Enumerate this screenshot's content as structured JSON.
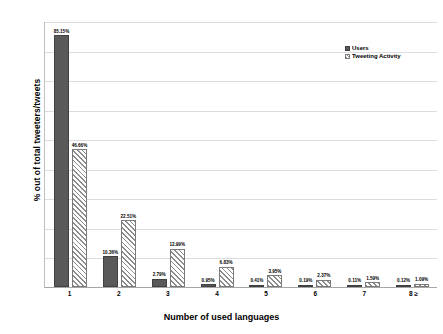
{
  "chart_data": {
    "type": "bar",
    "title": "",
    "xlabel": "Number of used languages",
    "ylabel": "% out of total tweeters/tweets",
    "categories": [
      "1",
      "2",
      "3",
      "4",
      "5",
      "6",
      "7",
      "8 ≥"
    ],
    "series": [
      {
        "name": "Users",
        "values": [
          85.15,
          10.36,
          2.79,
          0.95,
          0.41,
          0.19,
          0.11,
          0.12
        ],
        "labels": [
          "85.15%",
          "10.36%",
          "2.79%",
          "0.95%",
          "0.41%",
          "0.19%",
          "0.11%",
          "0.12%"
        ],
        "style": "solid",
        "color": "#595959"
      },
      {
        "name": "Tweeting Activity",
        "values": [
          46.66,
          22.51,
          12.99,
          6.83,
          3.95,
          2.37,
          1.59,
          1.09
        ],
        "labels": [
          "46.66%",
          "22.51%",
          "12.99%",
          "6.83%",
          "3.95%",
          "2.37%",
          "1.59%",
          "1.09%"
        ],
        "style": "diagonal-hatch",
        "color": "#8c8c8c"
      }
    ],
    "ylim": [
      0,
      90
    ],
    "y_tick_labels": [],
    "gridlines": [
      10,
      20,
      30,
      40,
      50,
      60,
      70,
      80,
      90
    ],
    "grid": true,
    "legend_position": "top-right"
  },
  "legend": {
    "items": [
      {
        "label": "Users",
        "swatch": "solid-dark-gray"
      },
      {
        "label": "Tweeting Activity",
        "swatch": "diagonal-hatch"
      }
    ]
  }
}
